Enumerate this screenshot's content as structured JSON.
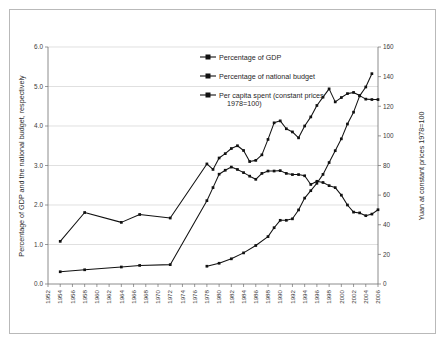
{
  "chart_data": {
    "type": "line",
    "title": "",
    "subtitle": "",
    "xlabel": "",
    "ylabel": "Percentage of GDP and the national budget, respectively",
    "y2label": "Yuan at constant prices 1978=100",
    "grid": true,
    "legend_position": "upper-center",
    "xlim": [
      1952,
      2006
    ],
    "ylim": [
      0.0,
      6.0
    ],
    "y2lim": [
      0,
      160
    ],
    "yticks": [
      "0.0",
      "1.0",
      "2.0",
      "3.0",
      "4.0",
      "5.0",
      "6.0"
    ],
    "y2ticks": [
      "0",
      "20",
      "40",
      "60",
      "80",
      "100",
      "120",
      "140",
      "160"
    ],
    "xticks": [
      "1952",
      "1954",
      "1956",
      "1958",
      "1960",
      "1962",
      "1964",
      "1966",
      "1968",
      "1970",
      "1972",
      "1974",
      "1976",
      "1978",
      "1980",
      "1982",
      "1984",
      "1986",
      "1988",
      "1990",
      "1992",
      "1994",
      "1996",
      "1998",
      "2000",
      "2002",
      "2004",
      "2006"
    ],
    "series": [
      {
        "name": "Percentage of GDP",
        "axis": "left",
        "x": [
          1954,
          1958,
          1964,
          1967,
          1972,
          1978,
          1979,
          1980,
          1981,
          1982,
          1983,
          1984,
          1985,
          1986,
          1987,
          1988,
          1989,
          1990,
          1991,
          1992,
          1993,
          1994,
          1995,
          1996,
          1997,
          1998,
          1999,
          2000,
          2001,
          2002,
          2003,
          2004,
          2005,
          2006
        ],
        "values": [
          0.31,
          0.36,
          0.43,
          0.47,
          0.49,
          2.11,
          2.44,
          2.78,
          2.88,
          2.96,
          2.9,
          2.82,
          2.73,
          2.65,
          2.8,
          2.86,
          2.86,
          2.87,
          2.8,
          2.77,
          2.77,
          2.74,
          2.52,
          2.6,
          2.57,
          2.49,
          2.44,
          2.25,
          2.0,
          1.82,
          1.8,
          1.73,
          1.77,
          1.88
        ]
      },
      {
        "name": "Percentage of national budget",
        "axis": "left",
        "x": [
          1954,
          1958,
          1964,
          1967,
          1972,
          1978,
          1979,
          1980,
          1981,
          1982,
          1983,
          1984,
          1985,
          1986,
          1987,
          1988,
          1989,
          1990,
          1991,
          1992,
          1993,
          1994,
          1995,
          1996,
          1997,
          1998,
          1999,
          2000,
          2001,
          2002,
          2003,
          2004,
          2005,
          2006
        ],
        "values": [
          1.08,
          1.81,
          1.56,
          1.76,
          1.67,
          3.04,
          2.9,
          3.19,
          3.3,
          3.43,
          3.5,
          3.38,
          3.1,
          3.13,
          3.27,
          3.66,
          4.08,
          4.13,
          3.93,
          3.85,
          3.7,
          4.0,
          4.23,
          4.52,
          4.73,
          4.94,
          4.61,
          4.72,
          4.82,
          4.85,
          4.77,
          4.68,
          4.67,
          4.67
        ]
      },
      {
        "name": "Per capita spent (constant prices 1978=100)",
        "axis": "right",
        "x": [
          1978,
          1980,
          1982,
          1984,
          1986,
          1988,
          1989,
          1990,
          1991,
          1992,
          1993,
          1994,
          1995,
          1996,
          1997,
          1998,
          1999,
          2000,
          2001,
          2002,
          2003,
          2004,
          2005
        ],
        "values": [
          12,
          14,
          17,
          21,
          26,
          32,
          38,
          43,
          43,
          44,
          50,
          58,
          63,
          68,
          74,
          82,
          90,
          98,
          108,
          116,
          127,
          133,
          142
        ]
      }
    ],
    "legend": [
      "Percentage of GDP",
      "Percentage of national budget",
      "Per capita spent (constant prices",
      "1978=100)"
    ]
  }
}
